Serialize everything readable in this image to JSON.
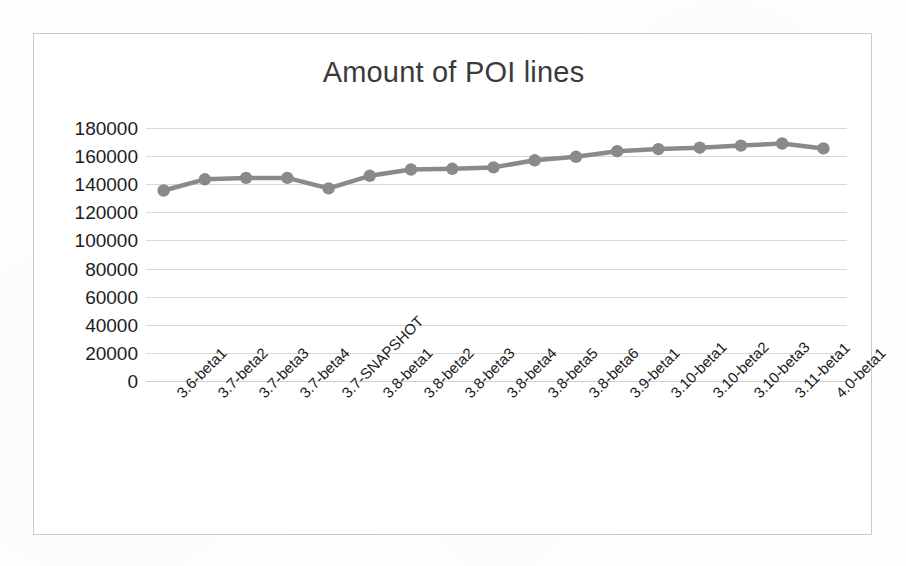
{
  "chart_data": {
    "type": "line",
    "title": "Amount of POI lines",
    "xlabel": "",
    "ylabel": "",
    "ylim": [
      0,
      180000
    ],
    "ytick_step": 20000,
    "yticks": [
      "180000",
      "160000",
      "140000",
      "120000",
      "100000",
      "80000",
      "60000",
      "40000",
      "20000",
      "0"
    ],
    "grid": true,
    "legend": "none",
    "series_color": "#8a8a8a",
    "marker": "circle",
    "categories": [
      "3.6-beta1",
      "3.7-beta2",
      "3.7-beta3",
      "3.7-beta4",
      "3.7-SNAPSHOT",
      "3.8-beta1",
      "3.8-beta2",
      "3.8-beta3",
      "3.8-beta4",
      "3.8-beta5",
      "3.8-beta6",
      "3.9-beta1",
      "3.10-beta1",
      "3.10-beta2",
      "3.10-beta3",
      "3.11-beta1",
      "4.0-beta1"
    ],
    "values": [
      135500,
      143500,
      144500,
      144500,
      137000,
      146000,
      150500,
      151000,
      152000,
      157000,
      159500,
      163500,
      165000,
      166000,
      167500,
      169000,
      165500
    ]
  },
  "figure": {
    "frame_border_color": "#c9c9c9",
    "gridline_color": "#d8d8d8",
    "background": "#ffffff",
    "text_color": "#1d1d1d"
  }
}
